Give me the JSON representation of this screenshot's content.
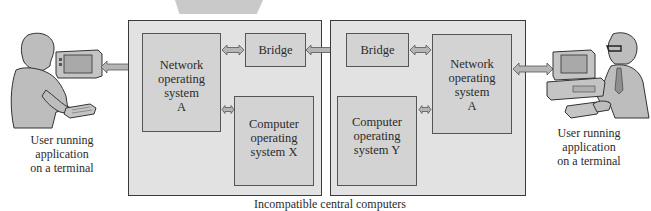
{
  "diagram": {
    "caption": "Incompatible central computers",
    "left_user": {
      "label": "User running\napplication\non a terminal"
    },
    "right_user": {
      "label": "User running\napplication\non a terminal"
    },
    "left_computer": {
      "network_os": "Network\noperating\nsystem\nA",
      "bridge": "Bridge",
      "computer_os": "Computer\noperating\nsystem X"
    },
    "right_computer": {
      "network_os": "Network\noperating\nsystem\nA",
      "bridge": "Bridge",
      "computer_os": "Computer\noperating\nsystem Y"
    },
    "colors": {
      "outer_box": "#e2e2e2",
      "inner_box": "#d3d3d3",
      "arrow": "#b5b5b5",
      "border": "#3a3a3a"
    }
  }
}
